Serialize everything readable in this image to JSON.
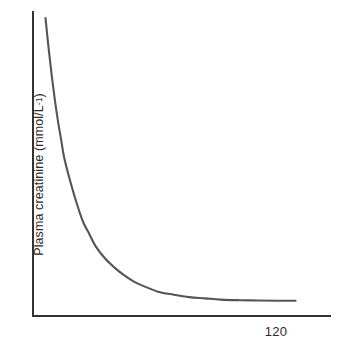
{
  "chart_data": {
    "type": "line",
    "title": "",
    "subtitle": "",
    "xlabel": "",
    "ylabel": "Plasma creatinine (mmol/L",
    "ylabel_superscript": "-1",
    "ylabel_suffix": ")",
    "ylabel_full": "Plasma creatinine (mmol/L-1)",
    "x_tick_labels": [
      "120"
    ],
    "y_tick_labels": [],
    "grid": false,
    "legend": false,
    "xlim": [
      0,
      190
    ],
    "ylim": [
      0,
      100
    ],
    "annotations": [],
    "series": [
      {
        "name": "plasma creatinine vs GFR",
        "color": "#555555",
        "x": [
          8,
          10,
          12,
          14,
          16,
          18,
          20,
          24,
          28,
          32,
          36,
          40,
          46,
          52,
          58,
          64,
          70,
          80,
          90,
          100,
          110,
          120,
          132,
          144,
          156,
          168
        ],
        "y": [
          98,
          88,
          79,
          71,
          64,
          58,
          52,
          44,
          37,
          31,
          27,
          23,
          19,
          16,
          13.5,
          11.5,
          10,
          8,
          7,
          6.2,
          5.8,
          5.4,
          5.2,
          5.1,
          5.0,
          5.0
        ]
      }
    ]
  },
  "axes": {
    "y_axis_name": "y-axis",
    "x_axis_name": "x-axis",
    "axis_color": "#333333"
  }
}
